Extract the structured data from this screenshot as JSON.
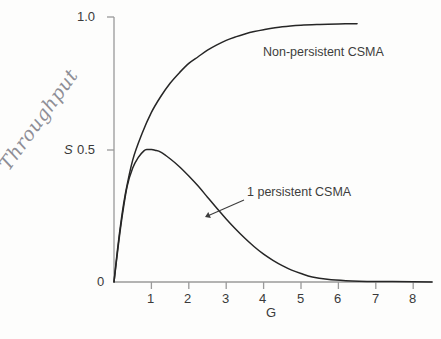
{
  "chart_data": {
    "type": "line",
    "title": "",
    "xlabel": "G",
    "ylabel": "S",
    "xlim": [
      0,
      8.5
    ],
    "ylim": [
      0,
      1.0
    ],
    "grid": false,
    "legend_position": "inline-annotations",
    "xticks": [
      "1",
      "2",
      "3",
      "4",
      "5",
      "6",
      "7",
      "8"
    ],
    "xtick_values": [
      1,
      2,
      3,
      4,
      5,
      6,
      7,
      8
    ],
    "yticks": [
      "0",
      "0.5",
      "1.0"
    ],
    "ytick_values": [
      0,
      0.5,
      1.0
    ],
    "series": [
      {
        "name": "Non-persistent CSMA",
        "x": [
          0,
          0.1,
          0.2,
          0.3,
          0.5,
          0.75,
          1.0,
          1.25,
          1.5,
          1.75,
          2.0,
          2.25,
          2.5,
          2.75,
          3.0,
          3.25,
          3.5,
          3.75,
          4.0,
          4.5,
          5.0,
          5.5,
          6.0,
          6.5
        ],
        "values": [
          0,
          0.13,
          0.24,
          0.33,
          0.46,
          0.56,
          0.64,
          0.7,
          0.75,
          0.79,
          0.825,
          0.85,
          0.875,
          0.895,
          0.912,
          0.925,
          0.936,
          0.945,
          0.952,
          0.963,
          0.969,
          0.972,
          0.974,
          0.975
        ]
      },
      {
        "name": "1 persistent CSMA",
        "x": [
          0,
          0.1,
          0.2,
          0.35,
          0.5,
          0.65,
          0.8,
          0.9,
          1.0,
          1.1,
          1.25,
          1.5,
          1.75,
          2.0,
          2.25,
          2.5,
          2.75,
          3.0,
          3.25,
          3.5,
          3.75,
          4.0,
          4.25,
          4.5,
          4.75,
          5.0,
          5.3,
          5.7,
          6.2,
          7.0,
          8.0,
          8.5
        ],
        "values": [
          0,
          0.12,
          0.23,
          0.36,
          0.43,
          0.47,
          0.495,
          0.5,
          0.5,
          0.497,
          0.49,
          0.465,
          0.435,
          0.4,
          0.362,
          0.32,
          0.278,
          0.238,
          0.2,
          0.165,
          0.133,
          0.105,
          0.082,
          0.062,
          0.045,
          0.032,
          0.019,
          0.01,
          0.005,
          0.002,
          0.001,
          0.0
        ]
      }
    ],
    "annotations": [
      {
        "name": "non-persistent-label",
        "text": "Non-persistent CSMA",
        "x_px": 263,
        "y_px": 52
      },
      {
        "name": "one-persistent-label",
        "text": "1 persistent CSMA",
        "x_px": 247,
        "y_px": 192,
        "leader_from": [
          244,
          200
        ],
        "leader_to": [
          205,
          217
        ]
      },
      {
        "name": "throughput-handwritten-note",
        "text": "Throughput",
        "x_px": 12,
        "y_px": 152,
        "rotation_deg": -54
      }
    ]
  },
  "axis": {
    "y_label": "S",
    "x_label": "G"
  },
  "colors": {
    "background": "#fdfdfc",
    "curve": "#262626",
    "axis": "#9a9a9a",
    "text": "#3a3a3a",
    "handwriting": "#8e8e96"
  }
}
